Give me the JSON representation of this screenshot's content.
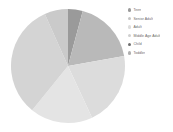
{
  "chart_data": {
    "type": "pie",
    "title": "",
    "legend_position": "right",
    "grid": false,
    "categories": [
      "Teen",
      "Senior Adult",
      "Adult",
      "Middle Age Adult",
      "Child",
      "Toddler"
    ],
    "values": [
      4.2,
      18.1,
      20.8,
      17.8,
      32.5,
      6.6
    ],
    "units": "percent",
    "start_angle_deg": 0,
    "direction": "clockwise",
    "slices": [
      {
        "label": "Teen",
        "value": 4.2,
        "start_deg": 0,
        "end_deg": 15,
        "color": "#9a9a9a"
      },
      {
        "label": "Senior Adult",
        "value": 18.1,
        "start_deg": 15,
        "end_deg": 80,
        "color": "#b9b9b9"
      },
      {
        "label": "Adult",
        "value": 20.8,
        "start_deg": 80,
        "end_deg": 155,
        "color": "#dcdcdc"
      },
      {
        "label": "Middle Age Adult",
        "value": 17.8,
        "start_deg": 155,
        "end_deg": 219,
        "color": "#e4e4e4"
      },
      {
        "label": "Child",
        "value": 32.5,
        "start_deg": 219,
        "end_deg": 336,
        "color": "#d4d4d4"
      },
      {
        "label": "Toddler",
        "value": 6.6,
        "start_deg": 336,
        "end_deg": 360,
        "color": "#cacaca"
      }
    ]
  },
  "legend": {
    "items": [
      {
        "label": "Teen",
        "color": "#9a9a9a"
      },
      {
        "label": "Senior Adult",
        "color": "#c4c4c4"
      },
      {
        "label": "Adult",
        "color": "#dcdcdc"
      },
      {
        "label": "Middle Age Adult",
        "color": "#cfcfcf"
      },
      {
        "label": "Child",
        "color": "#6f6f6f"
      },
      {
        "label": "Toddler",
        "color": "#b0b0b0"
      }
    ]
  },
  "figure": {
    "background": "#ffffff",
    "center_x": 68,
    "center_y": 66,
    "radius": 57
  }
}
